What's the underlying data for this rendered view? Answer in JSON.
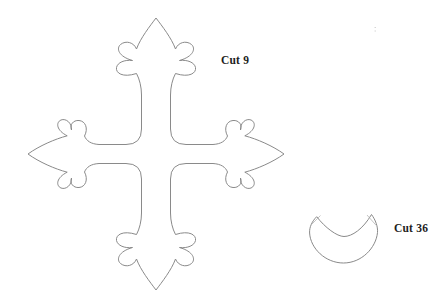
{
  "page": {
    "background": "#ffffff",
    "description_colors": {
      "outline_stroke": "#8a8a8a",
      "label_text": "#1e1e1e",
      "tip_mark_stroke": "#b5b5b5"
    }
  },
  "labels": {
    "cross_cut_count": "Cut 9",
    "collar_cut_count": "Cut 36"
  },
  "shapes": {
    "cross_template_path": "M 156,18 C 162,26 171.5,38 175.5,49 C 178,42.5 186,40 191.5,44.5 C 196,48.5 193.5,56.5 179.5,60.5 C 187.5,59.5 194.5,62.5 195.5,67.5 C 196.5,73 189.5,78 175.5,73.5 C 172.5,79 170.5,87 170.5,95 L 170.5,129 Q 170.5,144.5 186,144.5 L 213,144.5 C 221,144 225.5,141 227.5,136 C 223.5,128.5 226.5,121 233,120.5 C 239,120 242.5,125 240.5,130 C 240,123 246,118 251,120 C 256.5,122.5 255.5,130.5 244.8,135.8 C 257,139 273,146 284,154 C 273,162 257,169 244.8,172.2 C 255.5,177.5 256.5,185.5 251,188 C 246,190 240,185 240.5,178 C 242.5,183 239,188 233,187.5 C 226.5,187 223.5,179.5 227.5,172 C 225.5,167 221,164 213,163.5 L 186,163.5 Q 170.5,163.5 170.5,179 L 170.5,213 C 170.5,221 172.5,229 175.5,234.5 C 189.5,230 196.5,235 195.5,240.5 C 194.5,245.5 187.5,248.5 179.5,247.5 C 193.5,251.5 196,259.5 191.5,263.5 C 186,268 178,265.5 175.5,259 C 171.5,270 162,282 156,290 C 150,282 140.5,270 136.5,259 C 134,265.5 126,268 120.5,263.5 C 116,259.5 118.5,251.5 132.5,247.5 C 124.5,248.5 117.5,245.5 116.5,240.5 C 115.5,235 122.5,230 136.5,234.5 C 139.5,229 141.5,221 141.5,213 L 141.5,179 Q 141.5,163.5 126,163.5 L 99,163.5 C 91,164 86.5,167 84.5,172 C 88.5,179.5 85.5,187 79,187.5 C 73,188 69.5,183 71.5,178 C 72,185 66,190 61,188 C 55.5,185.5 56.5,177.5 67.2,172.2 C 55,169 39,162 28,154 C 39,146 55,139 67.2,135.8 C 56.5,130.5 55.5,122.5 61,120 C 66,118 72,123 71.5,130 C 69.5,125 73,120 79,120.5 C 85.5,121 88.5,128.5 84.5,136 C 86.5,141 91,144 99,144.5 L 126,144.5 Q 141.5,144.5 141.5,129 L 141.5,95 C 141.5,87 139.5,79 136.5,73.5 C 122.5,78 115.5,73 116.5,67.5 C 117.5,62.5 124.5,59.5 132.5,60.5 C 118.5,56.5 116,48.5 120.5,44.5 C 126,40 134,42.5 136.5,49 C 140.5,38 150,26 156,18 Z",
    "collar_template_path": "M 316.7,216.7 C 325,227.5 337,236.5 344,236.5 C 352,236.5 363,229 371.5,214.5 C 375.5,220 378,226.5 377.5,232.5 C 376,248 361.5,263 343.5,263 C 325.5,263 310.5,248.5 309.6,233 C 309.2,227 312.3,221 316.7,216.7 Z",
    "collar_tip_marks_path": "M 311.5,224.5 L 320.5,215.5 M 367,215 L 376.3,225.5",
    "scan_artifact_path": "M 374.5,27.5 L 376,27.5 M 374.5,31 L 376,31"
  }
}
